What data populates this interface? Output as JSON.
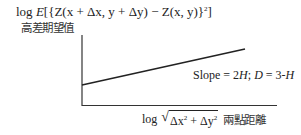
{
  "diagram": {
    "y_axis_label": {
      "formula_prefix": "log ",
      "formula_E": "E",
      "formula_body": "[{Z(x + Δx, y + Δy) − Z(x, y)}",
      "formula_exp": "2",
      "formula_close": "]",
      "chinese": "高差期望值"
    },
    "x_axis_label": {
      "prefix": "log ",
      "radicand_a": "Δx",
      "radicand_a_exp": "2",
      "radicand_plus": " + ",
      "radicand_b": "Δy",
      "radicand_b_exp": "2",
      "chinese": "兩點距離"
    },
    "annotation": {
      "slope_text": "Slope = 2",
      "H1": "H",
      "sep": "; ",
      "D": "D",
      "eq": " = 3-",
      "H2": "H"
    },
    "colors": {
      "axis": "#333333",
      "line": "#222222",
      "background": "#ffffff"
    }
  }
}
